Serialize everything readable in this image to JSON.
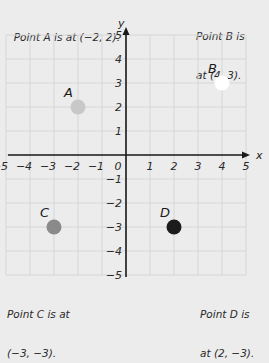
{
  "captions": {
    "a": "Point A is at (−2, 2).",
    "b_line1": "Point B is",
    "b_line2": "at (4, 3).",
    "c_line1": "Point C is at",
    "c_line2": "(−3, −3).",
    "d_line1": "Point D is",
    "d_line2": "at (2, −3)."
  },
  "axes": {
    "x_label": "x",
    "y_label": "y",
    "x_ticks": [
      "−5",
      "−4",
      "−3",
      "−2",
      "−1",
      "1",
      "2",
      "3",
      "4",
      "5"
    ],
    "y_ticks": [
      "5",
      "4",
      "3",
      "2",
      "1",
      "−1",
      "−2",
      "−3",
      "−4",
      "−5"
    ],
    "origin_label": "0"
  },
  "points": [
    {
      "name": "A",
      "x": -2,
      "y": 2,
      "color": "#c8c8c8"
    },
    {
      "name": "B",
      "x": 4,
      "y": 3,
      "color": "#ffffff"
    },
    {
      "name": "C",
      "x": -3,
      "y": -3,
      "color": "#8a8a8a"
    },
    {
      "name": "D",
      "x": 2,
      "y": -3,
      "color": "#1c1c1c"
    }
  ],
  "colors": {
    "background": "#ececec",
    "grid": "#d6d6d6",
    "axis": "#1a1a1a"
  },
  "chart_data": {
    "type": "scatter",
    "title": "",
    "xlabel": "x",
    "ylabel": "y",
    "xlim": [
      -5,
      5
    ],
    "ylim": [
      -5,
      5
    ],
    "grid": true,
    "series": [
      {
        "name": "A",
        "x": [
          -2
        ],
        "y": [
          2
        ]
      },
      {
        "name": "B",
        "x": [
          4
        ],
        "y": [
          3
        ]
      },
      {
        "name": "C",
        "x": [
          -3
        ],
        "y": [
          -3
        ]
      },
      {
        "name": "D",
        "x": [
          2
        ],
        "y": [
          -3
        ]
      }
    ],
    "annotations": [
      "Point A is at (−2, 2).",
      "Point B is at (4, 3).",
      "Point C is at (−3, −3).",
      "Point D is at (2, −3)."
    ]
  }
}
